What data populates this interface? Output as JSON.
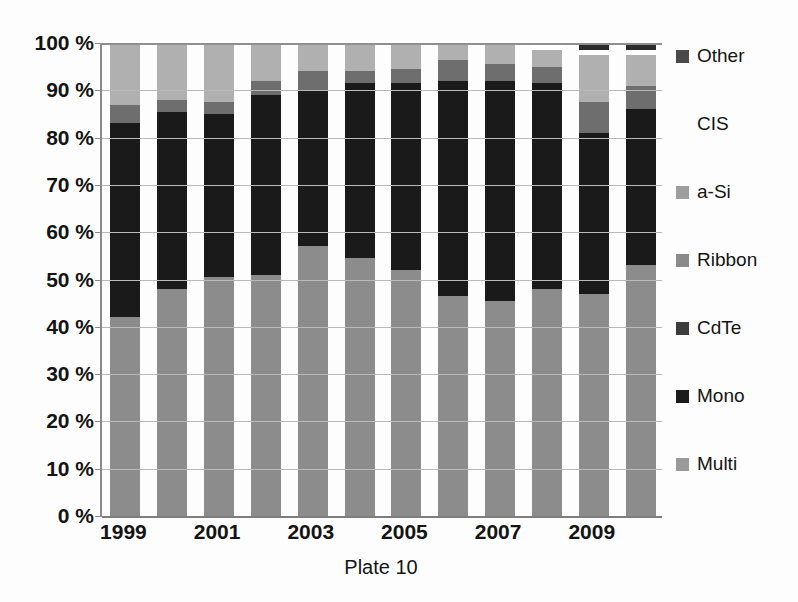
{
  "chart_data": {
    "type": "bar",
    "subtype": "stacked-percentage-column",
    "title": "",
    "plate_label": "Plate 10",
    "xlabel": "Plate 10",
    "ylabel": "",
    "ylim": [
      0,
      100
    ],
    "y_unit": "%",
    "grid": true,
    "legend_position": "right",
    "categories": [
      "1999",
      "2000",
      "2001",
      "2002",
      "2003",
      "2004",
      "2005",
      "2006",
      "2007",
      "2008",
      "2009",
      "2010"
    ],
    "x_tick_labels": [
      "1999",
      "",
      "2001",
      "",
      "2003",
      "",
      "2005",
      "",
      "2007",
      "",
      "2009",
      ""
    ],
    "y_tick_labels": [
      "0 %",
      "10 %",
      "20 %",
      "30 %",
      "40 %",
      "50 %",
      "60 %",
      "70 %",
      "80 %",
      "90 %",
      "100 %"
    ],
    "y_tick_values": [
      0,
      10,
      20,
      30,
      40,
      50,
      60,
      70,
      80,
      90,
      100
    ],
    "stack_order_bottom_to_top": [
      "Multi",
      "Mono",
      "CdTe",
      "Ribbon",
      "a-Si",
      "CIS",
      "Other"
    ],
    "series": [
      {
        "name": "Multi",
        "color": "#8c8c8c",
        "values": [
          42.0,
          48.0,
          50.5,
          51.0,
          57.0,
          54.5,
          52.0,
          46.5,
          45.5,
          48.0,
          47.0,
          53.0
        ]
      },
      {
        "name": "Mono",
        "color": "#1a1a1a",
        "values": [
          41.0,
          37.5,
          34.5,
          38.0,
          33.0,
          37.0,
          39.5,
          45.5,
          46.5,
          43.5,
          34.0,
          33.0
        ]
      },
      {
        "name": "CdTe",
        "color": "#3a3a3a",
        "values": [
          0.0,
          0.0,
          0.0,
          0.0,
          0.0,
          0.0,
          0.0,
          0.0,
          0.0,
          0.0,
          0.0,
          0.0
        ]
      },
      {
        "name": "Ribbon",
        "color": "#6e6e6e",
        "values": [
          4.0,
          2.5,
          2.5,
          3.0,
          4.0,
          2.5,
          3.0,
          4.5,
          3.5,
          3.5,
          6.5,
          5.0
        ]
      },
      {
        "name": "a-Si",
        "color": "#b0b0b0",
        "values": [
          13.0,
          12.0,
          12.5,
          8.0,
          6.0,
          6.0,
          5.5,
          3.5,
          4.5,
          3.5,
          10.0,
          6.5
        ]
      },
      {
        "name": "CIS",
        "color": "#ffffff",
        "values": [
          0.0,
          0.0,
          0.0,
          0.0,
          0.0,
          0.0,
          0.0,
          0.0,
          0.0,
          1.5,
          1.0,
          1.0
        ]
      },
      {
        "name": "Other",
        "color": "#2b2b2b",
        "values": [
          0.0,
          0.0,
          0.0,
          0.0,
          0.0,
          0.0,
          0.0,
          0.0,
          0.0,
          0.0,
          1.5,
          1.5
        ]
      }
    ]
  },
  "legend": {
    "items": [
      {
        "label": "Other",
        "color": "#4a4a4a",
        "swatch_visible": true
      },
      {
        "label": "CIS",
        "color": "#ffffff",
        "swatch_visible": false
      },
      {
        "label": "a-Si",
        "color": "#9e9e9e",
        "swatch_visible": true
      },
      {
        "label": "Ribbon",
        "color": "#8a8a8a",
        "swatch_visible": true
      },
      {
        "label": "CdTe",
        "color": "#3c3c3c",
        "swatch_visible": true
      },
      {
        "label": "Mono",
        "color": "#1c1c1c",
        "swatch_visible": true
      },
      {
        "label": "Multi",
        "color": "#9a9a9a",
        "swatch_visible": true
      }
    ]
  },
  "colors": {
    "background": "#fdfdfd",
    "axis": "#8a8a8a",
    "gridline": "#b9b9b9",
    "text": "#141414"
  }
}
